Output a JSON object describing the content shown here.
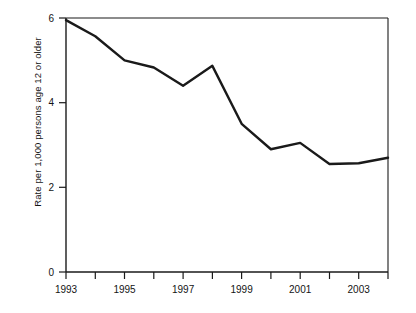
{
  "chart_data": {
    "type": "line",
    "title": "",
    "subtitle": "",
    "xlabel": "",
    "ylabel": "Rate per 1,000 persons age 12 or older",
    "x": [
      1993,
      1994,
      1995,
      1996,
      1997,
      1998,
      1999,
      2000,
      2001,
      2002,
      2003,
      2004
    ],
    "values": [
      5.95,
      5.57,
      5.0,
      4.83,
      4.4,
      4.87,
      3.5,
      2.9,
      3.05,
      2.55,
      2.57,
      2.7
    ],
    "series": [
      {
        "name": "Rate per 1,000 persons age 12 or older",
        "values": [
          5.95,
          5.57,
          5.0,
          4.83,
          4.4,
          4.87,
          3.5,
          2.9,
          3.05,
          2.55,
          2.57,
          2.7
        ]
      }
    ],
    "xlim": [
      1993,
      2004
    ],
    "ylim": [
      0,
      6
    ],
    "ytick_values": [
      0,
      2,
      4,
      6
    ],
    "ytick_labels": [
      "0",
      "2",
      "4",
      "6"
    ],
    "xtick_values": [
      1993,
      1994,
      1995,
      1996,
      1997,
      1998,
      1999,
      2000,
      2001,
      2002,
      2003,
      2004
    ],
    "xtick_labels": [
      "1993",
      "",
      "1995",
      "",
      "1997",
      "",
      "1999",
      "",
      "2001",
      "",
      "2003",
      ""
    ],
    "grid": false,
    "legend": false,
    "legend_position": "none",
    "line_color": "#1a1a1a",
    "axis_color": "#1a1a1a",
    "background_color": "#ffffff"
  },
  "axes": {
    "ylabel": "Rate per 1,000 persons age 12 or older",
    "ytick_0": "0",
    "ytick_1": "2",
    "ytick_2": "4",
    "ytick_3": "6",
    "xtick_1993": "1993",
    "xtick_1995": "1995",
    "xtick_1997": "1997",
    "xtick_1999": "1999",
    "xtick_2001": "2001",
    "xtick_2003": "2003"
  }
}
